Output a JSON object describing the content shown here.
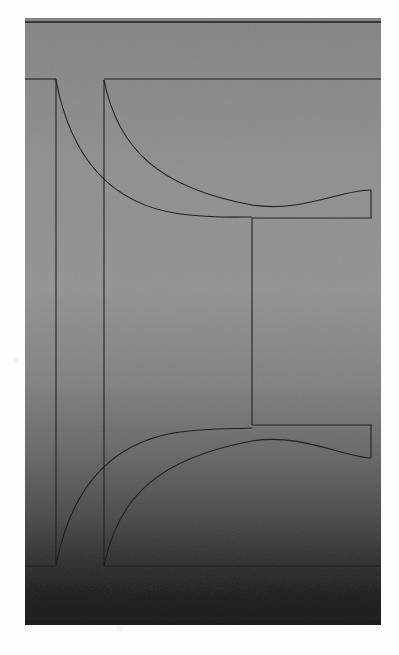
{
  "document": {
    "kind": "scanned-technical-drawing",
    "page_width": 399,
    "page_height": 655,
    "page_background": "#fdfdfb",
    "caption": "",
    "title": "",
    "visible_text": []
  },
  "figure": {
    "name": "hourglass-profile-section-drawing",
    "panel": {
      "x": 25,
      "y": 18,
      "width": 356,
      "height": 607,
      "gradient_stops": [
        {
          "offset": "0%",
          "color": "#a6a6a6"
        },
        {
          "offset": "8%",
          "color": "#a9a9a9"
        },
        {
          "offset": "26%",
          "color": "#b0b0b0"
        },
        {
          "offset": "45%",
          "color": "#b2b2b2"
        },
        {
          "offset": "60%",
          "color": "#a4a4a4"
        },
        {
          "offset": "72%",
          "color": "#8d8d8d"
        },
        {
          "offset": "83%",
          "color": "#6f6f6f"
        },
        {
          "offset": "91%",
          "color": "#4e4e4e"
        },
        {
          "offset": "96%",
          "color": "#3c3c3c"
        },
        {
          "offset": "100%",
          "color": "#343434"
        }
      ]
    },
    "ink_color": "#202020",
    "stroke_width": 1.1,
    "geometry": {
      "border_top_line": {
        "x1": 25,
        "y1": 22,
        "x2": 381,
        "y2": 22
      },
      "border_bottom_line": {
        "x1": 25,
        "y1": 618,
        "x2": 381,
        "y2": 618
      },
      "stub_top_left": {
        "x1": 25,
        "y1": 79,
        "x2": 56,
        "y2": 79
      },
      "stub_bottom_left": {
        "x1": 25,
        "y1": 566,
        "x2": 56,
        "y2": 566
      },
      "vertical_outer_left": {
        "x1": 56,
        "y1": 79,
        "x2": 56,
        "y2": 566
      },
      "vertical_inner_left": {
        "x1": 104,
        "y1": 80,
        "x2": 104,
        "y2": 566
      },
      "rail_top": {
        "x1": 104,
        "y1": 79,
        "x2": 381,
        "y2": 79
      },
      "rail_bottom": {
        "x1": 104,
        "y1": 566,
        "x2": 381,
        "y2": 566
      },
      "inset_vertical": {
        "x1": 252,
        "y1": 218,
        "x2": 252,
        "y2": 425
      },
      "inset_top_rail": {
        "x1": 252,
        "y1": 218,
        "x2": 372,
        "y2": 218
      },
      "inset_bottom_rail": {
        "x1": 252,
        "y1": 425,
        "x2": 372,
        "y2": 425
      },
      "inset_right_upper": {
        "x1": 371,
        "y1": 190,
        "x2": 371,
        "y2": 218
      },
      "inset_right_lower": {
        "x1": 371,
        "y1": 425,
        "x2": 371,
        "y2": 458
      },
      "curve_upper_outer": "M 104 80 C 118 150, 160 188, 252 205 C 300 213, 344 189, 371 190",
      "curve_upper_inner": "M 56 80 C 72 165, 116 205, 180 214 C 210 218, 232 217, 252 217",
      "curve_lower_outer": "M 104 566 C 118 496, 160 458, 252 441 C 300 433, 344 457, 371 458",
      "curve_lower_inner": "M 56 566 C 72 481, 116 441, 180 432 C 210 428, 232 429, 252 428"
    }
  }
}
